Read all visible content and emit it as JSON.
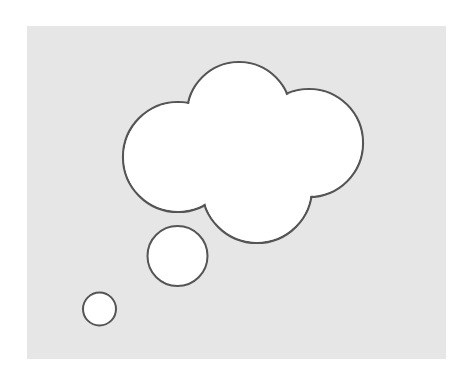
{
  "figure": {
    "type": "thought-bubble",
    "colors": {
      "page": "#ffffff",
      "panel": "#e6e6e6",
      "shape_fill": "#ffffff",
      "shape_stroke": "#555555"
    },
    "panel": {
      "x": 27,
      "y": 26,
      "width": 419,
      "height": 333
    },
    "cloud_lobes": [
      {
        "cx": 178,
        "cy": 157,
        "r": 55
      },
      {
        "cx": 239,
        "cy": 114,
        "r": 52
      },
      {
        "cx": 309,
        "cy": 143,
        "r": 54
      },
      {
        "cx": 257,
        "cy": 188,
        "r": 55
      }
    ],
    "trail_bubbles": [
      {
        "cx": 177.5,
        "cy": 256,
        "r": 30
      },
      {
        "cx": 99.5,
        "cy": 309,
        "r": 16.5
      }
    ]
  }
}
